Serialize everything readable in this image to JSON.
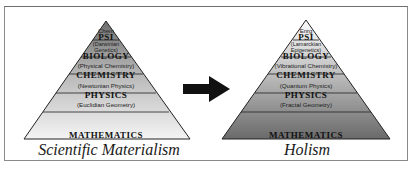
{
  "diagram": {
    "left_pyramid": {
      "title": "Scientific Materialism",
      "layers": [
        {
          "sub": "Chem",
          "name": "PSI"
        },
        {
          "sub": "(Darwinian Genetics)",
          "name": "BIOLOGY"
        },
        {
          "sub": "(Physical Chemistry)",
          "name": "CHEMISTRY"
        },
        {
          "sub": "(Newtonian Physics)",
          "name": "PHYSICS"
        },
        {
          "sub": "(Euclidian Geometry)",
          "name": "MATHEMATICS"
        }
      ],
      "colors": {
        "top": "#7a7a7a",
        "bottom": "#f2f2f2"
      }
    },
    "arrow": {
      "direction": "right",
      "color": "#111111"
    },
    "right_pyramid": {
      "title": "Holism",
      "layers": [
        {
          "sub": "Enrg",
          "name": "PSI"
        },
        {
          "sub": "(Lamarckian Epigenetics)",
          "name": "BIOLOGY"
        },
        {
          "sub": "(Vibrational Chemistry)",
          "name": "CHEMISTRY"
        },
        {
          "sub": "(Quantum Physics)",
          "name": "PHYSICS"
        },
        {
          "sub": "(Fractal Geometry)",
          "name": "MATHEMATICS"
        }
      ],
      "colors": {
        "top": "#f4f4f4",
        "bottom": "#6e6e6e"
      }
    }
  }
}
